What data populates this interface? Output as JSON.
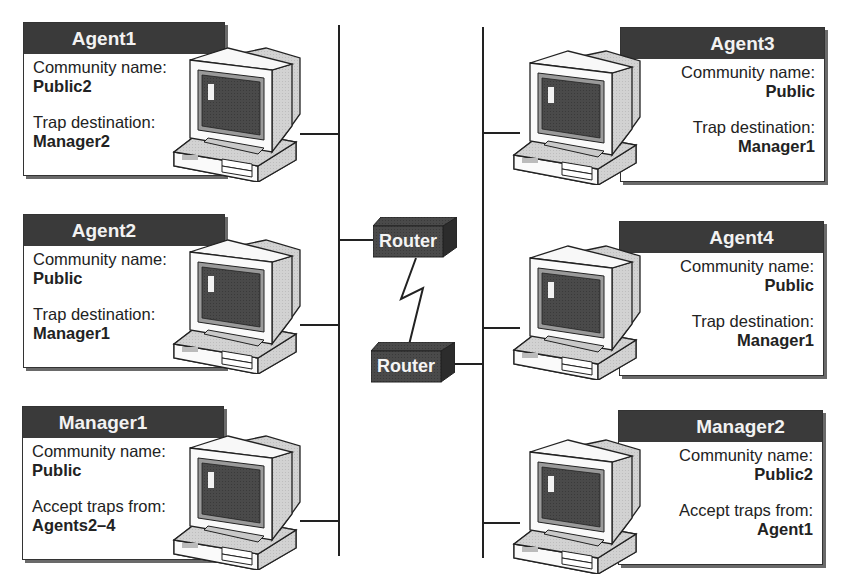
{
  "diagram": {
    "type": "snmp-network-topology",
    "colors": {
      "header_bg": "#3a3a3a",
      "header_text": "#f2f2f2",
      "line": "#222222",
      "shadow": "#6a6a6a",
      "router_fill": "#3a3a3a"
    },
    "left_nodes": [
      {
        "title": "Agent1",
        "field1_label": "Community name:",
        "field1_value": "Public2",
        "field2_label": "Trap destination:",
        "field2_value": "Manager2",
        "icon": "computer-icon"
      },
      {
        "title": "Agent2",
        "field1_label": "Community name:",
        "field1_value": "Public",
        "field2_label": "Trap destination:",
        "field2_value": "Manager1",
        "icon": "computer-icon"
      },
      {
        "title": "Manager1",
        "field1_label": "Community name:",
        "field1_value": "Public",
        "field2_label": "Accept traps from:",
        "field2_value": "Agents2–4",
        "icon": "computer-icon"
      }
    ],
    "right_nodes": [
      {
        "title": "Agent3",
        "field1_label": "Community name:",
        "field1_value": "Public",
        "field2_label": "Trap destination:",
        "field2_value": "Manager1",
        "icon": "computer-icon"
      },
      {
        "title": "Agent4",
        "field1_label": "Community name:",
        "field1_value": "Public",
        "field2_label": "Trap destination:",
        "field2_value": "Manager1",
        "icon": "computer-icon"
      },
      {
        "title": "Manager2",
        "field1_label": "Community name:",
        "field1_value": "Public2",
        "field2_label": "Accept traps from:",
        "field2_value": "Agent1",
        "icon": "computer-icon"
      }
    ],
    "routers": [
      {
        "label": "Router",
        "icon": "router-icon"
      },
      {
        "label": "Router",
        "icon": "router-icon"
      }
    ],
    "links": [
      {
        "from": "left-network",
        "to": "router-1"
      },
      {
        "from": "router-1",
        "to": "router-2",
        "style": "wan-zigzag"
      },
      {
        "from": "router-2",
        "to": "right-network"
      }
    ]
  }
}
